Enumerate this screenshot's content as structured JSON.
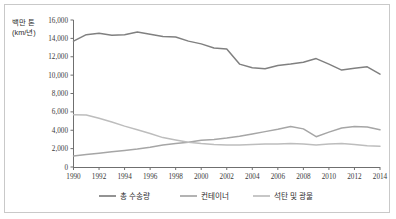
{
  "chart_data": {
    "type": "line",
    "title": "",
    "subtitle": "",
    "xlabel": "",
    "ylabel": "백만 톤 (km/년)",
    "ylabel_line1": "백만 톤",
    "ylabel_line2": "(km/년)",
    "grid": false,
    "legend_position": "bottom",
    "xlim": [
      1990,
      2014
    ],
    "ylim": [
      0,
      16000
    ],
    "ytick_labels": [
      "16,000",
      "14,000",
      "12,000",
      "10,000",
      "8,000",
      "6,000",
      "4,000",
      "2,000",
      "0"
    ],
    "ytick_values": [
      16000,
      14000,
      12000,
      10000,
      8000,
      6000,
      4000,
      2000,
      0
    ],
    "xtick_labels": [
      "1990",
      "1992",
      "1994",
      "1996",
      "1998",
      "2000",
      "2002",
      "2004",
      "2006",
      "2008",
      "2010",
      "2012",
      "2014"
    ],
    "xtick_values": [
      1990,
      1992,
      1994,
      1996,
      1998,
      2000,
      2002,
      2004,
      2006,
      2008,
      2010,
      2012,
      2014
    ],
    "x": [
      1990,
      1991,
      1992,
      1993,
      1994,
      1995,
      1996,
      1997,
      1998,
      1999,
      2000,
      2001,
      2002,
      2003,
      2004,
      2005,
      2006,
      2007,
      2008,
      2009,
      2010,
      2011,
      2012,
      2013,
      2014
    ],
    "series": [
      {
        "name": "총 수송량",
        "color": "#808080",
        "values": [
          13700,
          14400,
          14550,
          14350,
          14400,
          14700,
          14450,
          14200,
          14150,
          13700,
          13400,
          12950,
          12850,
          11200,
          10800,
          10700,
          11050,
          11200,
          11400,
          11800,
          11200,
          10550,
          10750,
          10900,
          10100
        ]
      },
      {
        "name": "컨테이너",
        "color": "#a6a6a6",
        "values": [
          1200,
          1350,
          1500,
          1650,
          1800,
          1950,
          2150,
          2400,
          2550,
          2700,
          2900,
          3000,
          3150,
          3350,
          3600,
          3850,
          4100,
          4400,
          4150,
          3300,
          3800,
          4250,
          4400,
          4350,
          4050
        ]
      },
      {
        "name": "석탄 및 광물",
        "color": "#bdbdbd",
        "values": [
          5700,
          5650,
          5300,
          4900,
          4450,
          4050,
          3650,
          3200,
          2950,
          2700,
          2550,
          2450,
          2400,
          2400,
          2450,
          2500,
          2500,
          2550,
          2500,
          2400,
          2500,
          2550,
          2450,
          2300,
          2250
        ]
      }
    ]
  },
  "legend": {
    "items": [
      {
        "label": "총 수송량",
        "color": "#808080"
      },
      {
        "label": "컨테이너",
        "color": "#a6a6a6"
      },
      {
        "label": "석탄 및 광물",
        "color": "#bdbdbd"
      }
    ]
  }
}
